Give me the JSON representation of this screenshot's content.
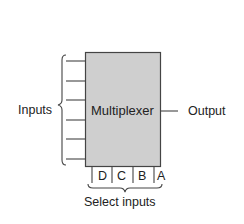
{
  "diagram": {
    "block": {
      "label": "Multiplexer",
      "fill": "#cfcfcf",
      "stroke": "#444444"
    },
    "inputs_label": "Inputs",
    "output_label": "Output",
    "select_label": "Select inputs",
    "input_count": 6,
    "select_inputs": [
      "D",
      "C",
      "B",
      "A"
    ]
  }
}
